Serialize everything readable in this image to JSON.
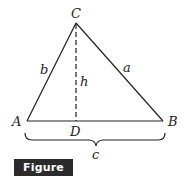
{
  "figure": {
    "caption": "Figure 3.21",
    "colors": {
      "stroke": "#222222",
      "caption_bg": "#2b2b2b",
      "caption_text": "#ffffff"
    },
    "vertices": {
      "A": {
        "label": "A",
        "x": 27,
        "y": 121
      },
      "B": {
        "label": "B",
        "x": 163,
        "y": 121
      },
      "C": {
        "label": "C",
        "x": 76,
        "y": 23
      },
      "D": {
        "label": "D",
        "x": 76,
        "y": 121
      }
    },
    "sides": {
      "a": "a",
      "b": "b",
      "c": "c"
    },
    "altitude": {
      "label": "h",
      "style": "dashed"
    }
  }
}
